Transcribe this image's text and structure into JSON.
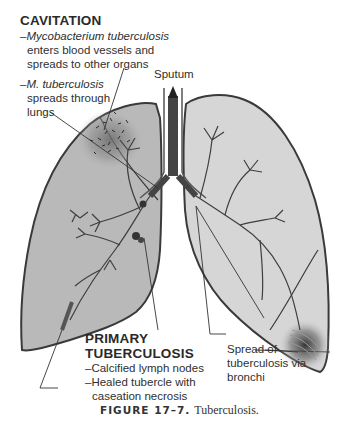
{
  "diagram": {
    "type": "anatomical-illustration",
    "subject": "lungs",
    "colors": {
      "left_lung_fill": "#b9b9b9",
      "right_lung_fill": "#d6d6d6",
      "outline": "#3a3a3a",
      "infection_shading": "#555555",
      "trachea": "#444444"
    }
  },
  "labels": {
    "cavitation": {
      "heading": "CAVITATION",
      "line1_prefix": "–",
      "line1_italic": "Mycobacterium tuberculosis",
      "line2": "enters blood vessels and",
      "line3": "spreads to other organs",
      "line4_prefix": "–",
      "line4_italic": "M. tuberculosis",
      "line5": "spreads through",
      "line6": "lungs"
    },
    "sputum": "Sputum",
    "primary": {
      "heading1": "PRIMARY",
      "heading2": "TUBERCULOSIS",
      "item1": "–Calcified lymph nodes",
      "item2": "–Healed tubercle with",
      "item2_cont": "caseation necrosis"
    },
    "spread": {
      "line1": "Spread of",
      "line2": "tuberculosis via",
      "line3": "bronchi"
    }
  },
  "caption": {
    "figure_label": "FIGURE 17–7.",
    "text": "Tuberculosis."
  }
}
